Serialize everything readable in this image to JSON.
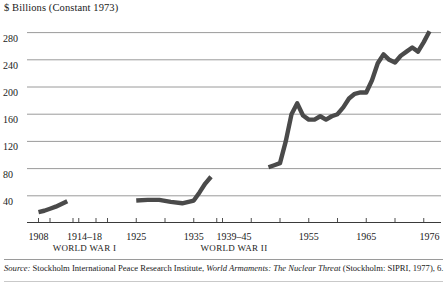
{
  "chart_data": {
    "type": "line",
    "title": "",
    "ylabel": "$ Billions (Constant 1973)",
    "xlabel": "",
    "ylim": [
      0,
      300
    ],
    "xlim": [
      1906,
      1978
    ],
    "grid": true,
    "legend": false,
    "yticks": [
      40,
      80,
      120,
      160,
      200,
      240,
      280
    ],
    "ytick_labels": [
      "40",
      "80",
      "120",
      "160",
      "200",
      "240",
      "280"
    ],
    "xticks": [
      1908,
      1914,
      1918,
      1925,
      1935,
      1939,
      1945,
      1955,
      1965,
      1976
    ],
    "xtick_labels": [
      "1908",
      "1914–18",
      "1925",
      "1935",
      "1939–45",
      "1955",
      "1965",
      "1976"
    ],
    "annotations": [
      "WORLD WAR I",
      "WORLD WAR II"
    ],
    "series": [
      {
        "name": "World military expenditure (pre-WWI)",
        "x": [
          1908,
          1909,
          1910,
          1911,
          1912,
          1913
        ],
        "values": [
          16,
          18,
          21,
          24,
          28,
          32
        ]
      },
      {
        "name": "World military expenditure (interwar)",
        "x": [
          1925,
          1927,
          1929,
          1931,
          1933,
          1935,
          1936,
          1937,
          1938
        ],
        "values": [
          33,
          34,
          34,
          31,
          29,
          33,
          45,
          58,
          68
        ]
      },
      {
        "name": "World military expenditure (postwar)",
        "x": [
          1948,
          1949,
          1950,
          1951,
          1952,
          1953,
          1954,
          1955,
          1956,
          1957,
          1958,
          1959,
          1960,
          1961,
          1962,
          1963,
          1964,
          1965,
          1966,
          1967,
          1968,
          1969,
          1970,
          1971,
          1972,
          1973,
          1974,
          1975,
          1976
        ],
        "values": [
          82,
          85,
          88,
          120,
          160,
          176,
          158,
          152,
          152,
          157,
          152,
          157,
          160,
          170,
          183,
          190,
          192,
          192,
          210,
          235,
          248,
          240,
          236,
          246,
          252,
          258,
          252,
          266,
          282
        ]
      }
    ],
    "line_color": "#4a4a4a",
    "grid_color": "#8f8f8f"
  },
  "axis_title": "$ Billions (Constant 1973)",
  "xaxis": {
    "ticks": [
      {
        "label": "1908",
        "year": 1908
      },
      {
        "label": "1914–18",
        "year": 1916
      },
      {
        "label": "1925",
        "year": 1925
      },
      {
        "label": "1935",
        "year": 1935
      },
      {
        "label": "1939–45",
        "year": 1942
      },
      {
        "label": "1955",
        "year": 1955
      },
      {
        "label": "1965",
        "year": 1965
      },
      {
        "label": "1976",
        "year": 1976
      }
    ],
    "wars": [
      {
        "label": "WORLD WAR I",
        "year": 1916
      },
      {
        "label": "WORLD WAR II",
        "year": 1942
      }
    ]
  },
  "source": {
    "label": "Source:",
    "text_before": " Stockholm International Peace Research Institute, ",
    "title": "World Armaments: The Nuclear Threat",
    "text_after": " (Stockholm: SIPRI, 1977), 6."
  }
}
